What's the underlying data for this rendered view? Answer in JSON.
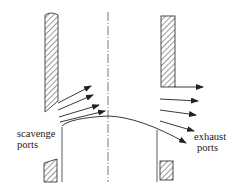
{
  "diagram": {
    "type": "two-stroke cross-scavenging cylinder schematic",
    "labels": {
      "scavenge_line1": "scavenge",
      "scavenge_line2": "ports",
      "exhaust_line1": "exhaust",
      "exhaust_line2": "ports"
    },
    "colors": {
      "line": "#222222",
      "background": "#ffffff"
    }
  }
}
